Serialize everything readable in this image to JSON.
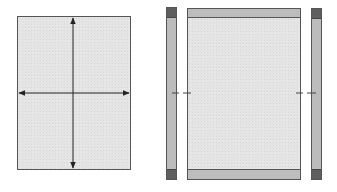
{
  "figure": {
    "left_panel": {
      "label": "",
      "fill": "#e4e4e4",
      "border": "#555555",
      "box": {
        "x": 17,
        "y": 16,
        "w": 114,
        "h": 154
      },
      "arrows": {
        "color": "#222222",
        "center": {
          "x": 73,
          "y": 93
        },
        "horizontal": {
          "x1": 19,
          "x2": 129
        },
        "vertical": {
          "y1": 18,
          "y2": 168
        }
      }
    },
    "right_assembly": {
      "center_panel": {
        "fill": "#e4e4e4",
        "border": "#555555",
        "box": {
          "x": 187,
          "y": 8,
          "w": 114,
          "h": 172
        },
        "top_band": {
          "h": 9,
          "fill": "#bdbdbd"
        },
        "bottom_band": {
          "h": 10,
          "fill": "#bdbdbd"
        }
      },
      "left_strip": {
        "box": {
          "x": 166,
          "y": 7,
          "w": 11,
          "h": 173
        },
        "fill": "#bcbcbc",
        "cap_fill": "#5e5e5e",
        "cap_h": 10,
        "border": "#555555"
      },
      "right_strip": {
        "box": {
          "x": 311,
          "y": 8,
          "w": 11,
          "h": 172
        },
        "fill": "#bcbcbc",
        "cap_fill": "#5e5e5e",
        "cap_h": 10,
        "border": "#555555"
      },
      "dash_marks": {
        "y": 93,
        "color": "#444444",
        "left": [
          {
            "x1": 172,
            "x2": 179
          },
          {
            "x1": 183,
            "x2": 191
          }
        ],
        "right": [
          {
            "x1": 296,
            "x2": 303
          },
          {
            "x1": 307,
            "x2": 316
          }
        ]
      }
    }
  }
}
